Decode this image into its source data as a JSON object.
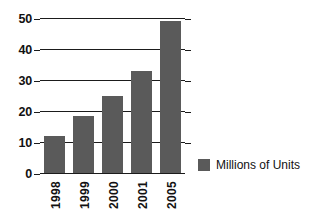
{
  "chart_data": {
    "type": "bar",
    "title": "",
    "xlabel": "",
    "ylabel": "",
    "categories": [
      "1998",
      "1999",
      "2000",
      "2001",
      "2005"
    ],
    "values": [
      12,
      18.5,
      25,
      33,
      49
    ],
    "series": [
      {
        "name": "Millions of Units",
        "values": [
          12,
          18.5,
          25,
          33,
          49
        ]
      }
    ],
    "ylim": [
      0,
      50
    ],
    "ytick_labels": [
      "0",
      "10",
      "20",
      "30",
      "40",
      "50"
    ],
    "ytick_values": [
      0,
      10,
      20,
      30,
      40,
      50
    ],
    "grid": true,
    "legend_position": "right",
    "bar_color": "#5a5a5a",
    "axis_color": "#1b1b1b",
    "background": "#ffffff"
  },
  "legend": {
    "entries": [
      {
        "label": "Millions of Units",
        "color": "#5a5a5a",
        "swatch": "legend-swatch-icon"
      }
    ]
  }
}
